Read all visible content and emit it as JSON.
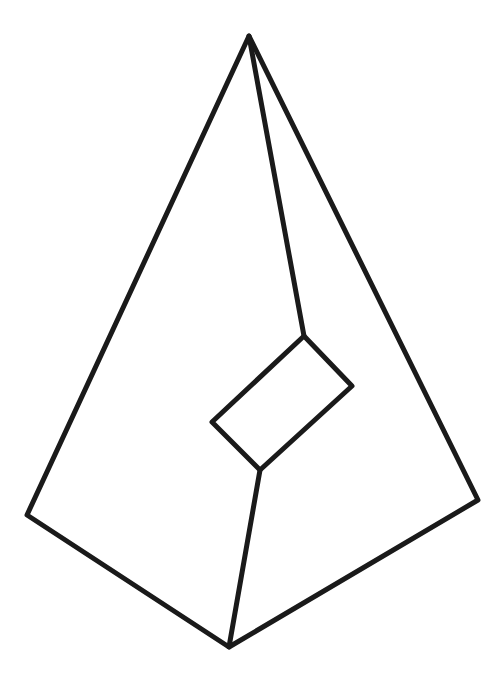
{
  "figure": {
    "stroke_color": "#1a1a1a",
    "background": "#ffffff",
    "stroke_width": 5,
    "vertices": {
      "apex": [
        249,
        36
      ],
      "left": [
        27,
        515
      ],
      "right": [
        478,
        500
      ],
      "bottom": [
        229,
        647
      ],
      "rect_top": [
        304,
        336
      ],
      "rect_right": [
        352,
        386
      ],
      "rect_bottom": [
        260,
        470
      ],
      "rect_left": [
        212,
        422
      ]
    }
  }
}
